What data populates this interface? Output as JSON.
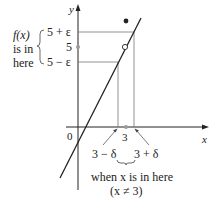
{
  "diagram": {
    "axis_labels": {
      "y": "y",
      "x": "x",
      "origin": "0"
    },
    "left_annotation": {
      "line1": "f(x)",
      "line2": "is in",
      "line3": "here"
    },
    "y_ticks": {
      "upper": "5 + ε",
      "mid": "5",
      "lower": "5 − ε"
    },
    "x_ticks": {
      "mid": "3",
      "left": "3 − δ",
      "right": "3 + δ"
    },
    "bottom_annotation": {
      "line1": "when x is in here",
      "line2": "(x ≠ 3)"
    },
    "colors": {
      "ink": "#222222",
      "guide": "#777777",
      "point_fill": "#9a9a9a"
    }
  }
}
